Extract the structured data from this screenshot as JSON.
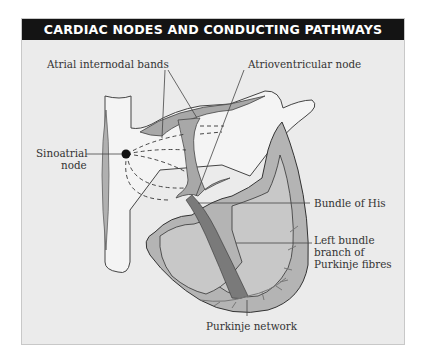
{
  "title": "CARDIAC NODES AND CONDUCTING PATHWAYS",
  "labels": {
    "atrial_internodal_bands": "Atrial internodal bands",
    "atrioventricular_node": "Atrioventricular node",
    "sinoatrial_node_line1": "Sinoatrial",
    "sinoatrial_node_line2": "node",
    "bundle_of_his": "Bundle of His",
    "left_bundle_line1": "Left bundle",
    "left_bundle_line2": "branch of",
    "left_bundle_line3": "Purkinje fibres",
    "purkinje_network": "Purkinje network"
  },
  "colors": {
    "title_bar": "#141414",
    "panel_bg": "#ebebeb",
    "heart_wall": "#a8a8a8",
    "chamber": "#c4c4c4",
    "pathway": "#707070"
  }
}
